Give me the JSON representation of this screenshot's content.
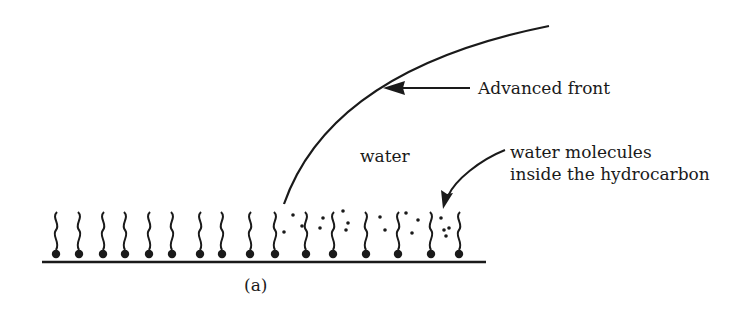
{
  "figure": {
    "panel_label": "(a)",
    "labels": {
      "advanced_front": "Advanced front",
      "water": "water",
      "water_molecules_line1": "water molecules",
      "water_molecules_line2": "inside the hydrocarbon"
    },
    "colors": {
      "ink": "#1a1a1a",
      "background": "#ffffff"
    },
    "molecules": {
      "dry_heads_x": [
        56,
        79,
        103,
        125,
        149,
        172,
        200,
        222,
        250,
        275
      ],
      "wet_heads_x": [
        306,
        333,
        366,
        398,
        431,
        459
      ],
      "head_y": 254,
      "tail_top_y": 212
    },
    "water_dots": [
      [
        293,
        215
      ],
      [
        284,
        232
      ],
      [
        302,
        226
      ],
      [
        323,
        218
      ],
      [
        320,
        228
      ],
      [
        343,
        211
      ],
      [
        348,
        223
      ],
      [
        346,
        230
      ],
      [
        380,
        217
      ],
      [
        385,
        230
      ],
      [
        406,
        213
      ],
      [
        418,
        220
      ],
      [
        412,
        233
      ],
      [
        441,
        218
      ],
      [
        444,
        230
      ],
      [
        449,
        228
      ],
      [
        446,
        236
      ]
    ],
    "substrate": {
      "x1": 42,
      "x2": 486,
      "y": 262
    }
  }
}
